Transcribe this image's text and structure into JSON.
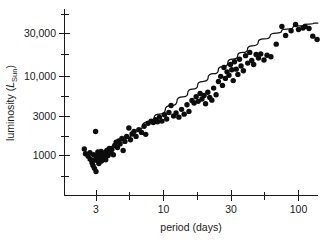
{
  "chart_data": {
    "type": "scatter",
    "title": "",
    "subtitle": "",
    "xlabel": "period (days)",
    "ylabel_prefix": "luminosity (",
    "ylabel_symbol": "L",
    "ylabel_subscript": "Sun",
    "ylabel_suffix": ")",
    "ylabel_full": "luminosity (LSun)",
    "xscale": "log",
    "yscale": "log",
    "xlim": [
      2.1,
      170
    ],
    "ylim": [
      330,
      62000
    ],
    "grid": false,
    "legend": null,
    "xticks_major": [
      3,
      10,
      30,
      100
    ],
    "xtick_labels": [
      "3",
      "10",
      "30",
      "100"
    ],
    "xticks_minor": [
      5,
      20,
      50,
      150
    ],
    "yticks_major": [
      1000,
      3000,
      10000,
      30000
    ],
    "ytick_labels": [
      "1000",
      "3000",
      "10,000",
      "30,000"
    ],
    "yticks_minor": [
      500,
      1700,
      5500,
      17000,
      55000
    ],
    "annotations": [],
    "series": [
      {
        "name": "Cepheid variables",
        "marker": "filled-circle",
        "color": "#0d0d0d",
        "points": [
          [
            2.45,
            1200
          ],
          [
            2.5,
            1050
          ],
          [
            2.62,
            980
          ],
          [
            2.7,
            1080
          ],
          [
            2.72,
            900
          ],
          [
            2.8,
            820
          ],
          [
            2.85,
            760
          ],
          [
            2.88,
            1020
          ],
          [
            2.92,
            700
          ],
          [
            2.95,
            880
          ],
          [
            2.98,
            1950
          ],
          [
            3.0,
            640
          ],
          [
            3.02,
            950
          ],
          [
            3.05,
            1010
          ],
          [
            3.08,
            870
          ],
          [
            3.1,
            1100
          ],
          [
            3.15,
            800
          ],
          [
            3.18,
            1000
          ],
          [
            3.22,
            930
          ],
          [
            3.28,
            1120
          ],
          [
            3.3,
            860
          ],
          [
            3.35,
            1020
          ],
          [
            3.42,
            960
          ],
          [
            3.5,
            1080
          ],
          [
            3.55,
            890
          ],
          [
            3.62,
            1150
          ],
          [
            3.7,
            1000
          ],
          [
            3.78,
            1220
          ],
          [
            3.85,
            1080
          ],
          [
            3.95,
            1180
          ],
          [
            4.05,
            1020
          ],
          [
            4.15,
            1320
          ],
          [
            4.25,
            1450
          ],
          [
            4.35,
            1250
          ],
          [
            4.45,
            1500
          ],
          [
            4.55,
            1380
          ],
          [
            4.7,
            1600
          ],
          [
            4.8,
            1150
          ],
          [
            4.95,
            1480
          ],
          [
            5.1,
            1700
          ],
          [
            5.3,
            2150
          ],
          [
            5.45,
            1550
          ],
          [
            5.6,
            1820
          ],
          [
            5.8,
            1950
          ],
          [
            6.0,
            1700
          ],
          [
            6.3,
            2050
          ],
          [
            6.6,
            1900
          ],
          [
            6.9,
            2250
          ],
          [
            7.1,
            1800
          ],
          [
            7.4,
            2450
          ],
          [
            7.8,
            2600
          ],
          [
            8.1,
            2500
          ],
          [
            8.4,
            2700
          ],
          [
            8.7,
            2550
          ],
          [
            9.0,
            2900
          ],
          [
            9.4,
            2600
          ],
          [
            9.8,
            3100
          ],
          [
            10.2,
            2750
          ],
          [
            10.6,
            3300
          ],
          [
            11.0,
            4000
          ],
          [
            11.5,
            3000
          ],
          [
            12.0,
            3250
          ],
          [
            12.6,
            2900
          ],
          [
            13.2,
            3600
          ],
          [
            13.8,
            3150
          ],
          [
            14.5,
            4100
          ],
          [
            15.0,
            3400
          ],
          [
            15.8,
            4600
          ],
          [
            16.4,
            4300
          ],
          [
            17.0,
            5100
          ],
          [
            17.6,
            4500
          ],
          [
            18.2,
            5600
          ],
          [
            18.8,
            4800
          ],
          [
            19.5,
            5300
          ],
          [
            20.0,
            4200
          ],
          [
            20.8,
            5800
          ],
          [
            21.5,
            5000
          ],
          [
            22.3,
            4650
          ],
          [
            23.0,
            6500
          ],
          [
            24.0,
            5400
          ],
          [
            25.0,
            7800
          ],
          [
            26.0,
            9000
          ],
          [
            26.8,
            7000
          ],
          [
            27.5,
            11500
          ],
          [
            28.2,
            8500
          ],
          [
            29.0,
            10200
          ],
          [
            30.0,
            9300
          ],
          [
            30.8,
            12500
          ],
          [
            31.5,
            10800
          ],
          [
            32.3,
            8000
          ],
          [
            33.0,
            13500
          ],
          [
            34.0,
            11000
          ],
          [
            35.0,
            9500
          ],
          [
            36.0,
            14500
          ],
          [
            37.0,
            12000
          ],
          [
            38.5,
            10500
          ],
          [
            40.0,
            16000
          ],
          [
            41.5,
            13000
          ],
          [
            43.0,
            17500
          ],
          [
            44.5,
            14000
          ],
          [
            46.0,
            12500
          ],
          [
            48.0,
            16500
          ],
          [
            50.0,
            15000
          ],
          [
            52.0,
            16800
          ],
          [
            55.0,
            14200
          ],
          [
            58.0,
            16200
          ],
          [
            62.0,
            15500
          ],
          [
            68.0,
            22000
          ],
          [
            75.0,
            36000
          ],
          [
            80.0,
            28000
          ],
          [
            88.0,
            32000
          ],
          [
            95.0,
            38000
          ],
          [
            100.0,
            33000
          ],
          [
            108.0,
            34500
          ],
          [
            112.0,
            36000
          ],
          [
            120.0,
            34000
          ],
          [
            128.0,
            27500
          ],
          [
            138.0,
            25000
          ]
        ]
      }
    ],
    "fit_curve": {
      "name": "period-luminosity relation",
      "style": "solid",
      "color": "#111111",
      "points": [
        [
          2.62,
          880
        ],
        [
          3.0,
          930
        ],
        [
          3.5,
          1080
        ],
        [
          4.2,
          1320
        ],
        [
          5.0,
          1600
        ],
        [
          6.0,
          2000
        ],
        [
          7.5,
          2550
        ],
        [
          9.0,
          3150
        ],
        [
          11.0,
          4000
        ],
        [
          13.5,
          5100
        ],
        [
          16.0,
          6300
        ],
        [
          19.0,
          7800
        ],
        [
          23.0,
          9700
        ],
        [
          27.0,
          11800
        ],
        [
          32.0,
          14500
        ],
        [
          38.0,
          17500
        ],
        [
          45.0,
          21000
        ],
        [
          55.0,
          25500
        ],
        [
          68.0,
          30000
        ],
        [
          82.0,
          33500
        ],
        [
          100.0,
          36500
        ],
        [
          120.0,
          38500
        ],
        [
          140.0,
          39500
        ]
      ]
    }
  }
}
